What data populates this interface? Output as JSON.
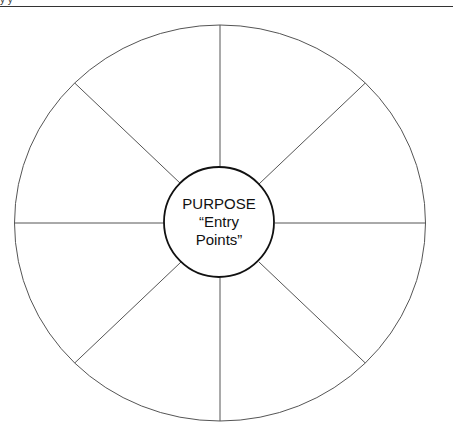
{
  "header": {
    "fragment": "y                                   y"
  },
  "diagram": {
    "type": "wheel",
    "segments": 8,
    "center": {
      "line1": "PURPOSE",
      "line2": "“Entry",
      "line3": "Points”"
    },
    "stroke_color": "#555555",
    "center_stroke_color": "#111111"
  }
}
